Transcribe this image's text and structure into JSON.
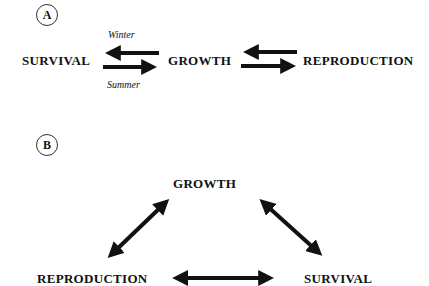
{
  "panel_a": {
    "label": "A",
    "nodes": {
      "survival": "SURVIVAL",
      "growth": "GROWTH",
      "reproduction": "REPRODUCTION"
    },
    "seasons": {
      "winter": "Winter",
      "summer": "Summer"
    },
    "edges": [
      {
        "from": "growth",
        "to": "survival",
        "label": "Winter"
      },
      {
        "from": "survival",
        "to": "growth",
        "label": "Summer"
      },
      {
        "from": "reproduction",
        "to": "growth"
      },
      {
        "from": "growth",
        "to": "reproduction"
      }
    ]
  },
  "panel_b": {
    "label": "B",
    "nodes": {
      "growth": "GROWTH",
      "reproduction": "REPRODUCTION",
      "survival": "SURVIVAL"
    },
    "edges": [
      {
        "between": [
          "growth",
          "reproduction"
        ],
        "type": "bidirectional"
      },
      {
        "between": [
          "growth",
          "survival"
        ],
        "type": "bidirectional"
      },
      {
        "between": [
          "reproduction",
          "survival"
        ],
        "type": "bidirectional"
      }
    ]
  },
  "colors": {
    "ink": "#111111",
    "background": "#ffffff"
  }
}
